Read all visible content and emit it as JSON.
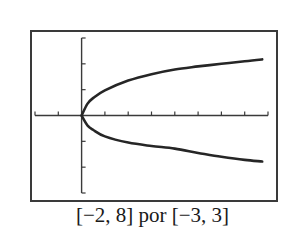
{
  "caption": "[−2, 8] por [−3, 3]",
  "chart_data": {
    "type": "line",
    "title": "",
    "caption": "[−2, 8] por [−3, 3]",
    "xlabel": "",
    "ylabel": "",
    "xlim": [
      -2,
      8
    ],
    "ylim": [
      -3,
      3
    ],
    "xtick_spacing": 1,
    "ytick_spacing": 1,
    "grid": false,
    "legend": null,
    "tick_labels_shown": false,
    "series": [
      {
        "name": "upper branch",
        "x": [
          0,
          0.25,
          0.5,
          1,
          2,
          3,
          4,
          5,
          6,
          7,
          7.75
        ],
        "y": [
          0,
          0.45,
          0.68,
          0.97,
          1.35,
          1.6,
          1.78,
          1.9,
          2.0,
          2.1,
          2.17
        ]
      },
      {
        "name": "lower branch",
        "x": [
          0,
          0.25,
          0.5,
          1,
          2,
          3,
          4,
          5,
          6,
          7,
          7.75
        ],
        "y": [
          0,
          -0.38,
          -0.56,
          -0.81,
          -1.05,
          -1.18,
          -1.28,
          -1.45,
          -1.6,
          -1.72,
          -1.78
        ]
      }
    ],
    "colors": {
      "curve": "#262626",
      "axis": "#3a3a3a",
      "frame": "#3a3a3a"
    }
  }
}
